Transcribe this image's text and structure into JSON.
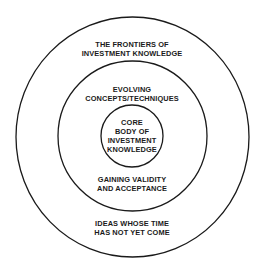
{
  "diagram": {
    "type": "concentric-circles",
    "stroke_color": "#1a1a1a",
    "background": "#ffffff",
    "rings": [
      {
        "name": "outer",
        "label_top": [
          "THE FRONTIERS OF",
          "INVESTMENT KNOWLEDGE"
        ],
        "label_bottom": [
          "IDEAS WHOSE TIME",
          "HAS NOT YET COME"
        ]
      },
      {
        "name": "middle",
        "label_top": [
          "EVOLVING",
          "CONCEPTS/TECHNIQUES"
        ],
        "label_bottom": [
          "GAINING VALIDITY",
          "AND ACCEPTANCE"
        ]
      },
      {
        "name": "core",
        "label_center": [
          "CORE",
          "BODY OF",
          "INVESTMENT",
          "KNOWLEDGE"
        ]
      }
    ]
  }
}
